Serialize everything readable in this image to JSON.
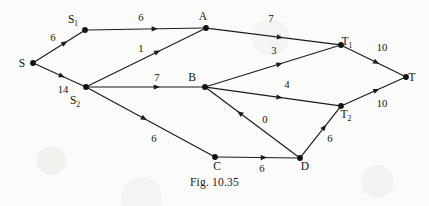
{
  "figure": {
    "caption": "Fig. 10.35",
    "kind": "directed network flow graph",
    "ink_color": "#1b1b1b",
    "paper_color": "#fbfbf9"
  },
  "chart_data": {
    "type": "diagram",
    "title": "Fig. 10.35",
    "graph_type": "directed weighted network",
    "nodes": [
      {
        "id": "S",
        "label": "S",
        "sub": "",
        "x": 33,
        "y": 63,
        "label_dx": -11,
        "label_dy": 4
      },
      {
        "id": "S1",
        "label": "S",
        "sub": "1",
        "x": 85,
        "y": 30,
        "label_dx": -12,
        "label_dy": -7
      },
      {
        "id": "S2",
        "label": "S",
        "sub": "2",
        "x": 86,
        "y": 87,
        "label_dx": -11,
        "label_dy": 17
      },
      {
        "id": "A",
        "label": "A",
        "sub": "",
        "x": 206,
        "y": 28,
        "label_dx": -3,
        "label_dy": -8
      },
      {
        "id": "B",
        "label": "B",
        "sub": "",
        "x": 205,
        "y": 87,
        "label_dx": -13,
        "label_dy": -6
      },
      {
        "id": "C",
        "label": "C",
        "sub": "",
        "x": 215,
        "y": 157,
        "label_dx": 2,
        "label_dy": 13
      },
      {
        "id": "D",
        "label": "D",
        "sub": "",
        "x": 300,
        "y": 158,
        "label_dx": 5,
        "label_dy": 12
      },
      {
        "id": "T1",
        "label": "T",
        "sub": "1",
        "x": 341,
        "y": 45,
        "label_dx": 6,
        "label_dy": 0
      },
      {
        "id": "T2",
        "label": "T",
        "sub": "2",
        "x": 341,
        "y": 106,
        "label_dx": 5,
        "label_dy": 12
      },
      {
        "id": "T",
        "label": "T",
        "sub": "",
        "x": 406,
        "y": 77,
        "label_dx": 6,
        "label_dy": 4
      }
    ],
    "edges": [
      {
        "from": "S",
        "to": "S1",
        "weight": "6",
        "label_x": 53,
        "label_y": 41,
        "head_t": 0.62
      },
      {
        "from": "S",
        "to": "S2",
        "weight": "14",
        "label_x": 63,
        "label_y": 93,
        "head_t": 0.55
      },
      {
        "from": "S1",
        "to": "A",
        "weight": "6",
        "label_x": 141,
        "label_y": 21,
        "head_t": 0.58
      },
      {
        "from": "S2",
        "to": "A",
        "weight": "1",
        "label_x": 141,
        "label_y": 52,
        "head_t": 0.6
      },
      {
        "from": "S2",
        "to": "B",
        "weight": "7",
        "label_x": 157,
        "label_y": 81,
        "head_t": 0.6
      },
      {
        "from": "S2",
        "to": "C",
        "weight": "6",
        "label_x": 154,
        "label_y": 142,
        "head_t": 0.45
      },
      {
        "from": "A",
        "to": "T1",
        "weight": "7",
        "label_x": 271,
        "label_y": 22,
        "head_t": 0.55
      },
      {
        "from": "B",
        "to": "T1",
        "weight": "3",
        "label_x": 274,
        "label_y": 54,
        "head_t": 0.55
      },
      {
        "from": "B",
        "to": "T2",
        "weight": "4",
        "label_x": 287,
        "label_y": 88,
        "head_t": 0.55
      },
      {
        "from": "D",
        "to": "B",
        "weight": "0",
        "label_x": 265,
        "label_y": 123,
        "head_t": 0.64
      },
      {
        "from": "C",
        "to": "D",
        "weight": "6",
        "label_x": 262,
        "label_y": 172,
        "head_t": 0.58
      },
      {
        "from": "D",
        "to": "T2",
        "weight": "6",
        "label_x": 330,
        "label_y": 142,
        "head_t": 0.6
      },
      {
        "from": "T1",
        "to": "T",
        "weight": "10",
        "label_x": 382,
        "label_y": 51,
        "head_t": 0.55
      },
      {
        "from": "T2",
        "to": "T",
        "weight": "10",
        "label_x": 382,
        "label_y": 107,
        "head_t": 0.55
      }
    ],
    "xlabel": "",
    "ylabel": "",
    "grid": false,
    "legend": "none"
  }
}
